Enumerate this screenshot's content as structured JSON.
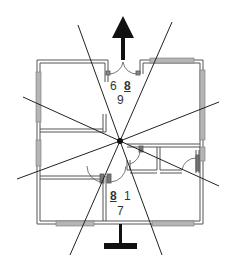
{
  "diagram": {
    "type": "floor-plan-with-sight-lines",
    "labels": {
      "top_left": "6",
      "top_right": "8",
      "top_bottom": "9",
      "bottom_left": "8",
      "bottom_right": "1",
      "bottom_bottom": "7"
    },
    "colors": {
      "wall": "#555555",
      "window": "#9a9a9a",
      "line": "#222222",
      "arrow": "#111111"
    }
  }
}
